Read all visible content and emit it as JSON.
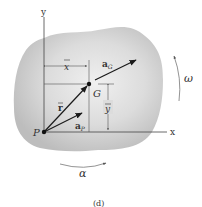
{
  "figure": {
    "caption": "(d)",
    "colors": {
      "body_fill": "#c8c8c8",
      "body_center": "#ececec",
      "line": "#333333",
      "vector": "#1a1a1a"
    }
  },
  "labels": {
    "y_axis": "y",
    "x_axis": "x",
    "point_p": "P",
    "point_g": "G",
    "x_bar": "x",
    "y_bar": "y",
    "r_bar": "r",
    "a_g_main": "a",
    "a_g_sub": "G",
    "a_p_main": "a",
    "a_p_sub": "P",
    "omega": "ω",
    "alpha": "α"
  }
}
